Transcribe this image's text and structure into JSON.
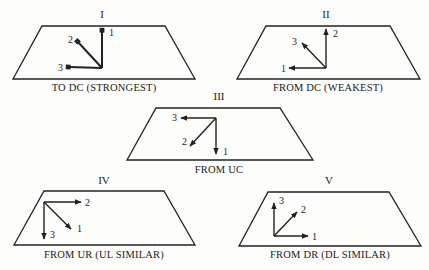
{
  "colors": {
    "ink": "#222222",
    "background": "#fdfdfc"
  },
  "panels": [
    {
      "id": "I",
      "title": "I",
      "caption": "TO DC (STRONGEST)",
      "direction": "inward",
      "trapezoid": [
        [
          42,
          26
        ],
        [
          165,
          26
        ],
        [
          195,
          79
        ],
        [
          13,
          79
        ]
      ],
      "origin": [
        102,
        68
      ],
      "title_pos": [
        102,
        18
      ],
      "caption_pos": [
        104,
        91
      ],
      "vectors": [
        {
          "label": "1",
          "tip": [
            102,
            31
          ],
          "label_pos": [
            109,
            36
          ]
        },
        {
          "label": "2",
          "tip": [
            78,
            42
          ],
          "label_pos": [
            68,
            43
          ]
        },
        {
          "label": "3",
          "tip": [
            69,
            67
          ],
          "label_pos": [
            58,
            71
          ]
        }
      ]
    },
    {
      "id": "II",
      "title": "II",
      "caption": "FROM DC (WEAKEST)",
      "direction": "outward",
      "trapezoid": [
        [
          266,
          26
        ],
        [
          390,
          26
        ],
        [
          420,
          79
        ],
        [
          237,
          79
        ]
      ],
      "origin": [
        326,
        68
      ],
      "title_pos": [
        326,
        18
      ],
      "caption_pos": [
        328,
        91
      ],
      "vectors": [
        {
          "label": "1",
          "tip": [
            289,
            68
          ],
          "label_pos": [
            281,
            72
          ]
        },
        {
          "label": "2",
          "tip": [
            326,
            29
          ],
          "label_pos": [
            333,
            37
          ]
        },
        {
          "label": "3",
          "tip": [
            302,
            43
          ],
          "label_pos": [
            292,
            45
          ]
        }
      ]
    },
    {
      "id": "III",
      "title": "III",
      "caption": "FROM UC",
      "direction": "outward",
      "trapezoid": [
        [
          156,
          108
        ],
        [
          280,
          108
        ],
        [
          313,
          160
        ],
        [
          127,
          160
        ]
      ],
      "origin": [
        216,
        118
      ],
      "title_pos": [
        219,
        100
      ],
      "caption_pos": [
        219,
        173
      ],
      "vectors": [
        {
          "label": "1",
          "tip": [
            216,
            154
          ],
          "label_pos": [
            223,
            155
          ]
        },
        {
          "label": "2",
          "tip": [
            190,
            146
          ],
          "label_pos": [
            182,
            145
          ]
        },
        {
          "label": "3",
          "tip": [
            181,
            118
          ],
          "label_pos": [
            172,
            121
          ]
        }
      ]
    },
    {
      "id": "IV",
      "title": "IV",
      "caption": "FROM UR (UL SIMILAR)",
      "direction": "outward",
      "trapezoid": [
        [
          44,
          191
        ],
        [
          164,
          191
        ],
        [
          195,
          245
        ],
        [
          14,
          245
        ]
      ],
      "origin": [
        44,
        202
      ],
      "title_pos": [
        104,
        184
      ],
      "caption_pos": [
        104,
        258
      ],
      "vectors": [
        {
          "label": "1",
          "tip": [
            71,
            229
          ],
          "label_pos": [
            77,
            232
          ]
        },
        {
          "label": "2",
          "tip": [
            81,
            202
          ],
          "label_pos": [
            85,
            206
          ]
        },
        {
          "label": "3",
          "tip": [
            44,
            239
          ],
          "label_pos": [
            50,
            238
          ]
        }
      ]
    },
    {
      "id": "V",
      "title": "V",
      "caption": "FROM DR (DL SIMILAR)",
      "direction": "outward",
      "trapezoid": [
        [
          268,
          192
        ],
        [
          389,
          192
        ],
        [
          421,
          246
        ],
        [
          239,
          246
        ]
      ],
      "origin": [
        274,
        236
      ],
      "title_pos": [
        329,
        184
      ],
      "caption_pos": [
        330,
        258
      ],
      "vectors": [
        {
          "label": "1",
          "tip": [
            308,
            236
          ],
          "label_pos": [
            312,
            240
          ]
        },
        {
          "label": "2",
          "tip": [
            297,
            212
          ],
          "label_pos": [
            301,
            213
          ]
        },
        {
          "label": "3",
          "tip": [
            274,
            203
          ],
          "label_pos": [
            279,
            204
          ]
        }
      ]
    }
  ]
}
